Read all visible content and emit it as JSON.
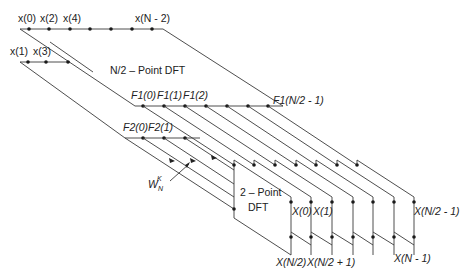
{
  "diagram": {
    "inputs_even": {
      "labels": [
        "x(0)",
        "x(2)",
        "x(4)",
        "x(N - 2)"
      ]
    },
    "inputs_odd": {
      "labels": [
        "x(1)",
        "x(3)"
      ]
    },
    "block_large": {
      "label": "N/2 – Point DFT"
    },
    "outputs_f1": {
      "labels": [
        "F1(0)",
        "F1(1)",
        "F1(2)",
        "F1(N/2 - 1)"
      ]
    },
    "outputs_f2": {
      "labels": [
        "F2(0)",
        "F2(1)"
      ]
    },
    "twiddle": {
      "label": "W",
      "sub": "N",
      "sup": "K"
    },
    "block_small": {
      "label_line1": "2 – Point",
      "label_line2": "DFT"
    },
    "outputs_top": {
      "labels": [
        "X(0)",
        "X(1)",
        "X(N/2 - 1)"
      ]
    },
    "outputs_bottom": {
      "labels": [
        "X(N/2)",
        "X(N/2 + 1)",
        "X(N - 1)"
      ]
    }
  }
}
